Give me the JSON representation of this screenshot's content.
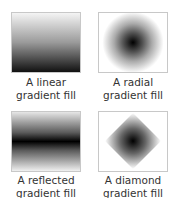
{
  "figures": [
    {
      "type": "linear",
      "caption_line1": "A linear",
      "caption_line2": "gradient fill"
    },
    {
      "type": "radial",
      "caption_line1": "A radial",
      "caption_line2": "gradient fill"
    },
    {
      "type": "reflected",
      "caption_line1": "A reflected",
      "caption_line2": "gradient fill"
    },
    {
      "type": "diamond",
      "caption_line1": "A diamond",
      "caption_line2": "gradient fill"
    }
  ],
  "colors": {
    "border": "#c8c8c8",
    "dark": "#000000",
    "light": "#ffffff",
    "caption": "#333333"
  }
}
